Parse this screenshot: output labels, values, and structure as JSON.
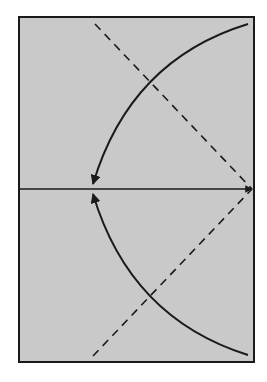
{
  "diagram": {
    "canvas": {
      "width": 267,
      "height": 382,
      "background": "#ffffff"
    },
    "panel": {
      "x": 19,
      "y": 17,
      "width": 235,
      "height": 345,
      "fill": "#c9c9c9",
      "stroke": "#1a1a1a",
      "stroke_width": 2
    },
    "axis_line": {
      "x1": 19,
      "y1": 189,
      "x2": 252,
      "y2": 189,
      "stroke": "#1a1a1a",
      "stroke_width": 1.5,
      "arrowhead_at": "end"
    },
    "dashed_lines": [
      {
        "name": "upper-dashed-line",
        "x1": 95,
        "y1": 24,
        "x2": 252,
        "y2": 189,
        "stroke": "#1a1a1a",
        "dash": "8,6"
      },
      {
        "name": "lower-dashed-line",
        "x1": 93,
        "y1": 356,
        "x2": 252,
        "y2": 189,
        "stroke": "#1a1a1a",
        "dash": "8,6"
      }
    ],
    "curved_arrows": [
      {
        "name": "upper-curved-arrow",
        "path": "M 248 24 Q 130 60 93 184",
        "stroke": "#1a1a1a",
        "stroke_width": 2,
        "arrowhead_at": "end"
      },
      {
        "name": "lower-curved-arrow",
        "path": "M 248 355 Q 130 318 93 194",
        "stroke": "#1a1a1a",
        "stroke_width": 2,
        "arrowhead_at": "end"
      }
    ]
  }
}
